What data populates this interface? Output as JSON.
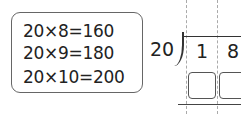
{
  "hint_box": {
    "equations": [
      "20×8=160",
      "20×9=180",
      "20×10=200"
    ]
  },
  "division": {
    "divisor": "20",
    "dividend_digits": [
      "1",
      "8"
    ],
    "answer_boxes": 2
  }
}
